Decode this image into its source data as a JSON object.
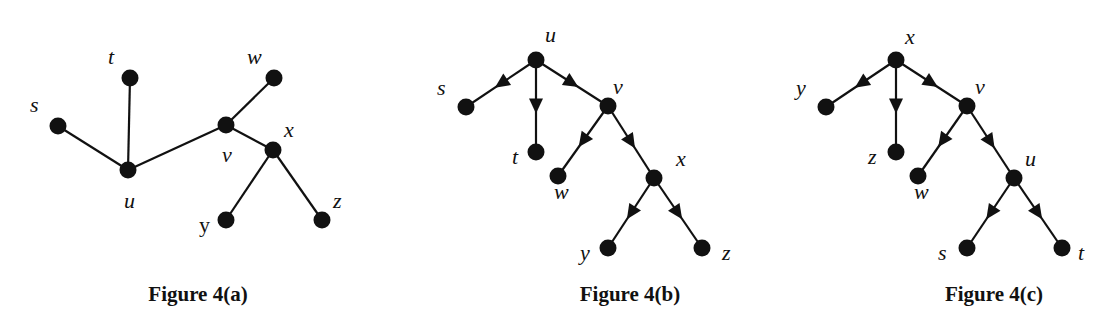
{
  "figures": [
    {
      "caption": "Figure 4(a)",
      "type": "undirected-tree",
      "nodes": [
        {
          "id": "s",
          "label": "s",
          "x": 58,
          "y": 126,
          "lx": 30,
          "ly": 112
        },
        {
          "id": "t",
          "label": "t",
          "x": 130,
          "y": 78,
          "lx": 108,
          "ly": 64
        },
        {
          "id": "u",
          "label": "u",
          "x": 128,
          "y": 170,
          "lx": 124,
          "ly": 208
        },
        {
          "id": "w",
          "label": "w",
          "x": 274,
          "y": 78,
          "lx": 247,
          "ly": 64
        },
        {
          "id": "v",
          "label": "v",
          "x": 226,
          "y": 125,
          "lx": 222,
          "ly": 162
        },
        {
          "id": "x",
          "label": "x",
          "x": 273,
          "y": 150,
          "lx": 284,
          "ly": 137
        },
        {
          "id": "y",
          "label": "y",
          "x": 226,
          "y": 220,
          "lx": 199,
          "ly": 232
        },
        {
          "id": "z",
          "label": "z",
          "x": 322,
          "y": 220,
          "lx": 333,
          "ly": 208
        }
      ],
      "edges": [
        [
          "s",
          "u"
        ],
        [
          "t",
          "u"
        ],
        [
          "u",
          "v"
        ],
        [
          "v",
          "w"
        ],
        [
          "v",
          "x"
        ],
        [
          "x",
          "y"
        ],
        [
          "x",
          "z"
        ]
      ]
    },
    {
      "caption": "Figure 4(b)",
      "type": "directed-tree",
      "root": "u",
      "nodes": [
        {
          "id": "u",
          "label": "u",
          "x": 536,
          "y": 60,
          "lx": 545,
          "ly": 42
        },
        {
          "id": "s",
          "label": "s",
          "x": 466,
          "y": 107,
          "lx": 437,
          "ly": 95
        },
        {
          "id": "t",
          "label": "t",
          "x": 536,
          "y": 152,
          "lx": 512,
          "ly": 164
        },
        {
          "id": "v",
          "label": "v",
          "x": 608,
          "y": 106,
          "lx": 613,
          "ly": 94
        },
        {
          "id": "w",
          "label": "w",
          "x": 558,
          "y": 176,
          "lx": 554,
          "ly": 199
        },
        {
          "id": "x",
          "label": "x",
          "x": 654,
          "y": 178,
          "lx": 676,
          "ly": 166
        },
        {
          "id": "y",
          "label": "y",
          "x": 608,
          "y": 248,
          "lx": 580,
          "ly": 260
        },
        {
          "id": "z",
          "label": "z",
          "x": 702,
          "y": 248,
          "lx": 722,
          "ly": 260
        }
      ],
      "edges": [
        [
          "u",
          "s"
        ],
        [
          "u",
          "t"
        ],
        [
          "u",
          "v"
        ],
        [
          "v",
          "w"
        ],
        [
          "v",
          "x"
        ],
        [
          "x",
          "y"
        ],
        [
          "x",
          "z"
        ]
      ]
    },
    {
      "caption": "Figure 4(c)",
      "type": "directed-tree",
      "root": "x",
      "nodes": [
        {
          "id": "x",
          "label": "x",
          "x": 896,
          "y": 60,
          "lx": 905,
          "ly": 44
        },
        {
          "id": "y",
          "label": "y",
          "x": 826,
          "y": 107,
          "lx": 796,
          "ly": 95
        },
        {
          "id": "z",
          "label": "z",
          "x": 896,
          "y": 152,
          "lx": 868,
          "ly": 164
        },
        {
          "id": "v",
          "label": "v",
          "x": 967,
          "y": 106,
          "lx": 975,
          "ly": 94
        },
        {
          "id": "w",
          "label": "w",
          "x": 918,
          "y": 176,
          "lx": 914,
          "ly": 199
        },
        {
          "id": "u",
          "label": "u",
          "x": 1014,
          "y": 178,
          "lx": 1025,
          "ly": 166
        },
        {
          "id": "s",
          "label": "s",
          "x": 967,
          "y": 248,
          "lx": 938,
          "ly": 260
        },
        {
          "id": "t",
          "label": "t",
          "x": 1062,
          "y": 248,
          "lx": 1078,
          "ly": 260
        }
      ],
      "edges": [
        [
          "x",
          "y"
        ],
        [
          "x",
          "z"
        ],
        [
          "x",
          "v"
        ],
        [
          "v",
          "w"
        ],
        [
          "v",
          "u"
        ],
        [
          "u",
          "s"
        ],
        [
          "u",
          "t"
        ]
      ]
    }
  ],
  "captions": {
    "a": "Figure 4(a)",
    "b": "Figure 4(b)",
    "c": "Figure 4(c)"
  },
  "colors": {
    "ink": "#111111",
    "background": "#ffffff"
  }
}
